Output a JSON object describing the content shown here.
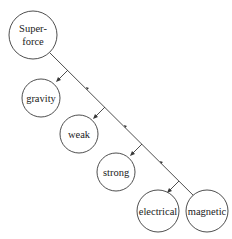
{
  "diagram": {
    "title": "",
    "nodes": [
      {
        "id": "superforce",
        "label_lines": [
          "Super-",
          "force"
        ]
      },
      {
        "id": "gravity",
        "label_lines": [
          "gravity"
        ]
      },
      {
        "id": "weak",
        "label_lines": [
          "weak"
        ]
      },
      {
        "id": "strong",
        "label_lines": [
          "strong"
        ]
      },
      {
        "id": "electrical",
        "label_lines": [
          "electrical"
        ]
      },
      {
        "id": "magnetic",
        "label_lines": [
          "magnetic"
        ]
      }
    ],
    "edges": [
      {
        "from": "superforce",
        "to": "gravity"
      },
      {
        "from": "superforce",
        "to": "weak"
      },
      {
        "from": "superforce",
        "to": "strong"
      },
      {
        "from": "superforce",
        "to": "electrical"
      },
      {
        "from": "superforce",
        "to": "magnetic"
      }
    ]
  }
}
